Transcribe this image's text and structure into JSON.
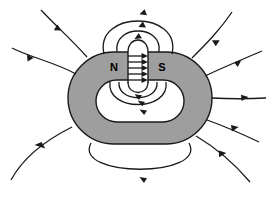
{
  "figure": {
    "background_color": "#ffffff",
    "line_color": "#1a1a1a",
    "magnet_fill_color": "#9e9e9e",
    "magnet_stroke_color": "#1a1a1a",
    "width": 268,
    "height": 205
  },
  "magnet": {
    "shape": "rounded-ring",
    "outer": {
      "x": 68,
      "y": 52,
      "width": 144,
      "height": 92,
      "corner_radius": 46
    },
    "inner_hole": {
      "x": 96,
      "y": 80,
      "width": 88,
      "height": 42,
      "corner_radius": 21
    },
    "gap": {
      "x": 128,
      "y": 52,
      "width": 20,
      "height": 34
    },
    "poles": [
      {
        "name": "north-pole",
        "label": "N",
        "label_x": 114,
        "label_y": 68
      },
      {
        "name": "south-pole",
        "label": "S",
        "label_x": 162,
        "label_y": 68
      }
    ]
  },
  "field_lines": {
    "gap_arrows": {
      "description": "Straight horizontal field arrows crossing the pole gap from N to S",
      "count": 5,
      "direction": "left-to-right",
      "x_start": 128,
      "x_end": 148,
      "y_values": [
        56,
        62,
        68,
        74,
        80
      ]
    },
    "top_arcs": {
      "description": "Nested arcs leaking out of the gap above the magnet, each with a rightward arrowhead at its apex",
      "count": 3,
      "direction": "left-to-right"
    },
    "bottom_arcs": {
      "description": "Nested arcs below the gap inside the ring hole, each with a rightward arrowhead",
      "count": 3,
      "direction": "left-to-right"
    },
    "outer_bottom_loop": {
      "description": "Large loop passing below the magnet body",
      "count": 1,
      "direction": "left-to-right"
    },
    "outer_left_lines": {
      "description": "Open field lines fanning out to the left, arrows point inward toward the magnet",
      "count": 3
    },
    "outer_right_lines": {
      "description": "Open field lines fanning out to the right, arrows point inward toward the magnet",
      "count": 4
    }
  }
}
